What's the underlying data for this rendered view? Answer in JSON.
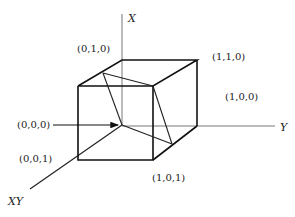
{
  "diagram": {
    "type": "unit-cube-coordinate-diagram",
    "axes": {
      "x_label": "X",
      "y_label": "Y",
      "diag_label": "XY"
    },
    "vertex_labels": {
      "v010": "(0,1,0)",
      "v110": "(1,1,0)",
      "v100": "(1,0,0)",
      "v000": "(0,0,0)",
      "v001": "(0,0,1)",
      "v101": "(1,0,1)"
    },
    "colors": {
      "edge": "#111111",
      "axis": "#777777",
      "text": "#222222"
    }
  }
}
